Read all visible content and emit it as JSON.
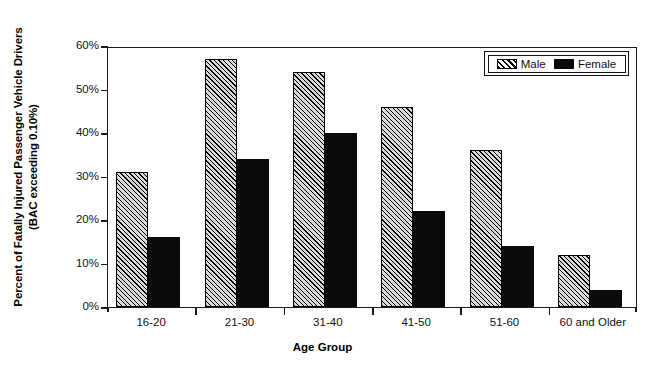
{
  "axes": {
    "y_title_line1": "Percent of Fatally Injured Passenger Vehicle Drivers",
    "y_title_line2": "(BAC exceeding 0.10%)",
    "x_title": "Age Group"
  },
  "legend": {
    "male_label": "Male",
    "female_label": "Female"
  },
  "chart_data": {
    "type": "bar",
    "title": "",
    "subtitle": "",
    "xlabel": "Age Group",
    "ylabel": "Percent of Fatally Injured Passenger Vehicle Drivers (BAC exceeding 0.10%)",
    "categories": [
      "16-20",
      "21-30",
      "31-40",
      "41-50",
      "51-60",
      "60 and Older"
    ],
    "series": [
      {
        "name": "Male",
        "values": [
          31,
          57,
          54,
          46,
          36,
          12
        ],
        "fill": "diagonal-hatch",
        "color": "#d8d8d8"
      },
      {
        "name": "Female",
        "values": [
          16,
          34,
          40,
          22,
          14,
          4
        ],
        "fill": "solid",
        "color": "#0a0a0a"
      }
    ],
    "ylim": [
      0,
      60
    ],
    "yticks": [
      0,
      10,
      20,
      30,
      40,
      50,
      60
    ],
    "ytick_labels": [
      "0%",
      "10%",
      "20%",
      "30%",
      "40%",
      "50%",
      "60%"
    ],
    "grid": false,
    "legend_position": "top-right-inside",
    "value_suffix": "%"
  }
}
